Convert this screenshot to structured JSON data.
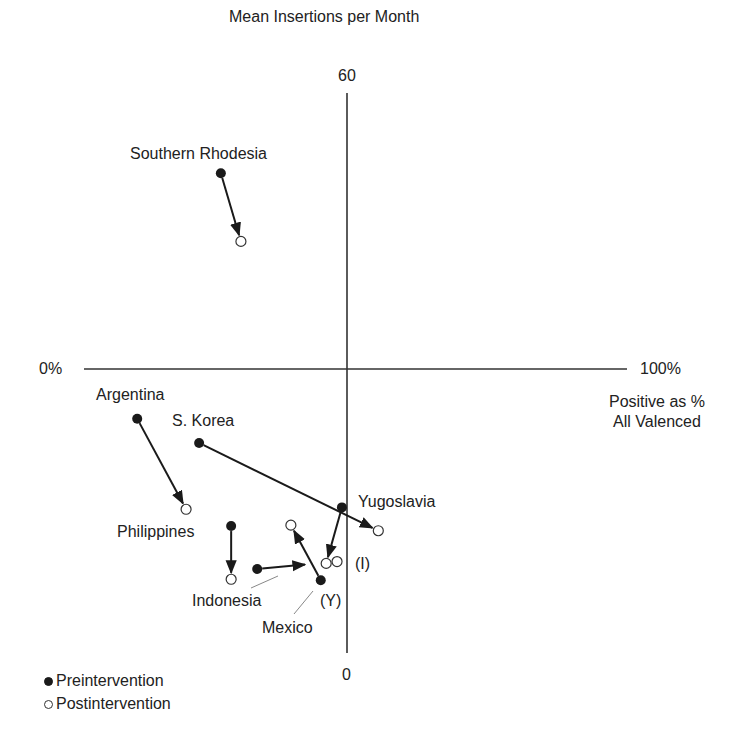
{
  "chart_data": {
    "type": "scatter",
    "title": "",
    "xlabel": "Positive as % All Valenced",
    "ylabel": "Mean Insertions per Month",
    "xlim": [
      0,
      100
    ],
    "ylim": [
      0,
      60
    ],
    "x_tick_labels": [
      "0%",
      "100%"
    ],
    "y_tick_labels": [
      "60",
      "0"
    ],
    "grid": false,
    "axes_style": "crosshair (quadrant) axes crossing at center",
    "legend_position": "bottom-left",
    "legend": [
      {
        "label": "Preintervention",
        "marker": "filled-circle"
      },
      {
        "label": "Postintervention",
        "marker": "open-circle"
      }
    ],
    "series": [
      {
        "name": "Southern Rhodesia",
        "pre": {
          "x": 25.2,
          "y": 51.4
        },
        "post": {
          "x": 28.9,
          "y": 44.1
        }
      },
      {
        "name": "Argentina",
        "pre": {
          "x": 9.8,
          "y": 25.1
        },
        "post": {
          "x": 18.8,
          "y": 15.4
        }
      },
      {
        "name": "S. Korea",
        "pre": {
          "x": 21.2,
          "y": 22.5
        },
        "post": {
          "x": 54.2,
          "y": 13.1
        }
      },
      {
        "name": "Yugoslavia",
        "pre": {
          "x": 47.5,
          "y": 15.6
        },
        "post": {
          "x": 44.6,
          "y": 9.6
        }
      },
      {
        "name": "Philippines",
        "pre": {
          "x": 27.1,
          "y": 13.6
        },
        "post": {
          "x": 27.1,
          "y": 7.9
        }
      },
      {
        "name": "Indonesia",
        "pre": {
          "x": 31.9,
          "y": 9.0
        },
        "post": {
          "x": 46.6,
          "y": 9.8
        }
      },
      {
        "name": "Mexico",
        "pre": {
          "x": 43.6,
          "y": 7.8
        },
        "post": {
          "x": 38.1,
          "y": 13.7
        }
      }
    ],
    "annotations": [
      "(I)",
      "(Y)"
    ]
  },
  "labels": {
    "y_axis_title": "Mean Insertions per Month",
    "y_max": "60",
    "y_min": "0",
    "x_min": "0%",
    "x_max": "100%",
    "x_axis_title_line1": "Positive as %",
    "x_axis_title_line2": "All Valenced",
    "countries": {
      "southern_rhodesia": "Southern Rhodesia",
      "argentina": "Argentina",
      "s_korea": "S. Korea",
      "yugoslavia": "Yugoslavia",
      "philippines": "Philippines",
      "indonesia": "Indonesia",
      "mexico": "Mexico"
    },
    "annot_i": "(I)",
    "annot_y": "(Y)"
  },
  "legend": {
    "pre": "Preintervention",
    "post": "Postintervention"
  },
  "colors": {
    "ink": "#1a1a1a",
    "axis": "#333333",
    "leader": "#777777",
    "background": "#ffffff"
  }
}
